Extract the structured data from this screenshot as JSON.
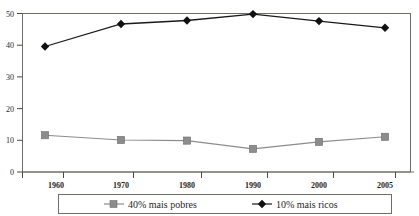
{
  "chart_data": {
    "type": "line",
    "title": "",
    "subtitle": "",
    "xlabel": "",
    "ylabel": "",
    "categories": [
      "1960",
      "1970",
      "1980",
      "1990",
      "2000",
      "2005"
    ],
    "x": [
      1960,
      1970,
      1980,
      1990,
      2000,
      2005
    ],
    "series": [
      {
        "name": "40% mais pobres",
        "marker": "square",
        "color": "#8c8c8c",
        "values": [
          11.6,
          10.1,
          9.9,
          7.3,
          9.5,
          11.1
        ]
      },
      {
        "name": "10% mais ricos",
        "marker": "diamond",
        "color": "#1a1a1a",
        "values": [
          39.6,
          46.7,
          47.8,
          49.8,
          47.6,
          45.5
        ]
      }
    ],
    "ylim": [
      0,
      50
    ],
    "yticks": [
      0,
      10,
      20,
      30,
      40,
      50
    ],
    "ytick_labels": [
      "0",
      "10",
      "20",
      "30",
      "40",
      "50"
    ],
    "xtick_labels": [
      "1960",
      "1970",
      "1980",
      "1990",
      "2000",
      "2005"
    ],
    "grid": false,
    "legend_position": "bottom",
    "frame": true
  },
  "axes": {
    "y_labels": [
      "50",
      "40",
      "30",
      "20",
      "10",
      "0"
    ],
    "x_labels": [
      "1960",
      "1970",
      "1980",
      "1990",
      "2000",
      "2005"
    ]
  },
  "legend": {
    "items": [
      {
        "label": "40% mais pobres",
        "marker": "square-marker",
        "color": "#8c8c8c"
      },
      {
        "label": "10% mais ricos",
        "marker": "diamond-marker",
        "color": "#1a1a1a"
      }
    ]
  },
  "colors": {
    "poorest_series": "#8c8c8c",
    "richest_series": "#1a1a1a",
    "frame": "#6e6e66",
    "background": "#ffffff"
  }
}
